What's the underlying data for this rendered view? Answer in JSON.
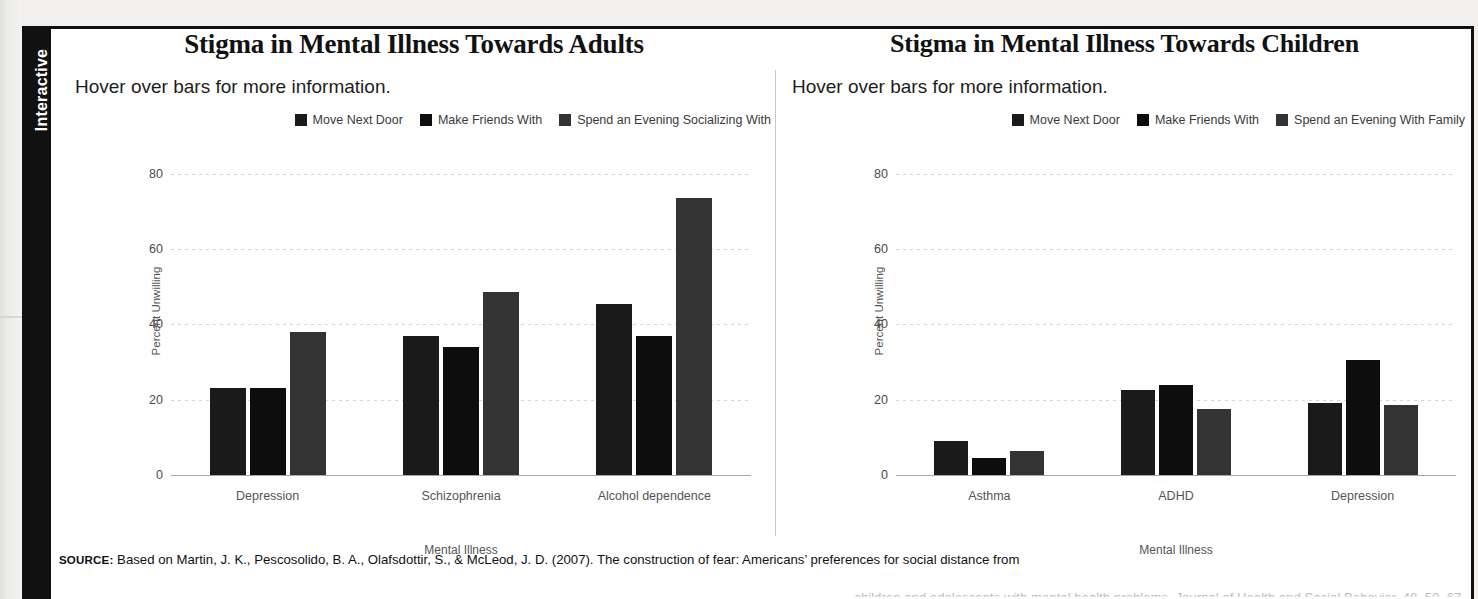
{
  "sidebar": {
    "tab_label": "Interactive"
  },
  "charts": [
    {
      "title": "Stigma in Mental Illness Towards Adults",
      "subtitle": "Hover over bars for more information.",
      "legend": [
        {
          "label": "Move Next Door",
          "color": "#1a1a1a"
        },
        {
          "label": "Make Friends With",
          "color": "#0d0d0d"
        },
        {
          "label": "Spend an Evening Socializing With",
          "color": "#333333"
        }
      ]
    },
    {
      "title": "Stigma in Mental Illness Towards Children",
      "subtitle": "Hover over bars for more information.",
      "legend": [
        {
          "label": "Move Next Door",
          "color": "#1a1a1a"
        },
        {
          "label": "Make Friends With",
          "color": "#0d0d0d"
        },
        {
          "label": "Spend an Evening With Family",
          "color": "#333333"
        }
      ]
    }
  ],
  "source": {
    "tag": "SOURCE:",
    "text": " Based on Martin, J. K., Pescosolido, B. A., Olafsdottir, S., & McLeod, J. D. (2007). The construction of fear: Americans’ preferences for social distance from",
    "line2": "children and adolescents with mental health problems. Journal of Health and Social Behavior, 48, 50–67."
  },
  "chart_data": [
    {
      "type": "bar",
      "title": "Stigma in Mental Illness Towards Adults",
      "xlabel": "Mental Illness",
      "ylabel": "Percent Unwilling",
      "ylim": [
        0,
        85
      ],
      "yticks": [
        0,
        20,
        40,
        60,
        80
      ],
      "grid": true,
      "legend_position": "top-right",
      "categories": [
        "Depression",
        "Schizophrenia",
        "Alcohol dependence"
      ],
      "series": [
        {
          "name": "Move Next Door",
          "color": "#1a1a1a",
          "values": [
            23,
            37,
            45.5
          ]
        },
        {
          "name": "Make Friends With",
          "color": "#0d0d0d",
          "values": [
            23,
            34,
            37
          ]
        },
        {
          "name": "Spend an Evening Socializing With",
          "color": "#333333",
          "values": [
            38,
            48.5,
            73.5
          ]
        }
      ]
    },
    {
      "type": "bar",
      "title": "Stigma in Mental Illness Towards Children",
      "xlabel": "Mental Illness",
      "ylabel": "Percent Unwilling",
      "ylim": [
        0,
        85
      ],
      "yticks": [
        0,
        20,
        40,
        60,
        80
      ],
      "grid": true,
      "legend_position": "top-right",
      "categories": [
        "Asthma",
        "ADHD",
        "Depression"
      ],
      "series": [
        {
          "name": "Move Next Door",
          "color": "#1a1a1a",
          "values": [
            9,
            22.5,
            19
          ]
        },
        {
          "name": "Make Friends With",
          "color": "#0d0d0d",
          "values": [
            4.5,
            24,
            30.5
          ]
        },
        {
          "name": "Spend an Evening With Family",
          "color": "#333333",
          "values": [
            6.5,
            17.5,
            18.5
          ]
        }
      ]
    }
  ]
}
